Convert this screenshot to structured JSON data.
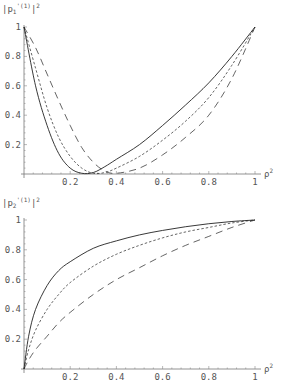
{
  "chart_data": [
    {
      "type": "line",
      "title": "",
      "ylabel": "|p1'(1)|^2",
      "xlabel": "ρ^2",
      "xlim": [
        0,
        1
      ],
      "ylim": [
        0,
        1
      ],
      "grid": false,
      "x_ticks": [
        "0.2",
        "0.4",
        "0.6",
        "0.8",
        "1"
      ],
      "y_ticks": [
        "0.2",
        "0.4",
        "0.6",
        "0.8",
        "1"
      ],
      "x": [
        0,
        0.05,
        0.1,
        0.15,
        0.2,
        0.25,
        0.3,
        0.35,
        0.4,
        0.5,
        0.6,
        0.7,
        0.8,
        0.9,
        1
      ],
      "series": [
        {
          "name": "solid",
          "style": "solid",
          "values": [
            1,
            0.6,
            0.33,
            0.14,
            0.04,
            0.005,
            0.01,
            0.05,
            0.1,
            0.2,
            0.33,
            0.47,
            0.62,
            0.8,
            1
          ]
        },
        {
          "name": "short-dashed",
          "style": "short-dash",
          "values": [
            1,
            0.72,
            0.45,
            0.25,
            0.12,
            0.04,
            0.005,
            0.01,
            0.04,
            0.12,
            0.23,
            0.36,
            0.52,
            0.74,
            1
          ]
        },
        {
          "name": "long-dashed",
          "style": "long-dash",
          "values": [
            1,
            0.86,
            0.68,
            0.5,
            0.33,
            0.18,
            0.08,
            0.02,
            0.005,
            0.04,
            0.13,
            0.25,
            0.4,
            0.65,
            1
          ]
        }
      ]
    },
    {
      "type": "line",
      "title": "",
      "ylabel": "|p2'(1)|^2",
      "xlabel": "ρ^2",
      "xlim": [
        0,
        1
      ],
      "ylim": [
        0,
        1
      ],
      "grid": false,
      "x_ticks": [
        "0.2",
        "0.4",
        "0.6",
        "0.8",
        "1"
      ],
      "y_ticks": [
        "0.2",
        "0.4",
        "0.6",
        "0.8",
        "1"
      ],
      "x": [
        0,
        0.02,
        0.05,
        0.1,
        0.15,
        0.2,
        0.3,
        0.4,
        0.5,
        0.6,
        0.7,
        0.8,
        0.9,
        1
      ],
      "series": [
        {
          "name": "solid",
          "style": "solid",
          "values": [
            0,
            0.22,
            0.4,
            0.56,
            0.66,
            0.72,
            0.81,
            0.86,
            0.9,
            0.93,
            0.955,
            0.975,
            0.99,
            1
          ]
        },
        {
          "name": "short-dashed",
          "style": "short-dash",
          "values": [
            0,
            0.13,
            0.26,
            0.4,
            0.5,
            0.58,
            0.69,
            0.77,
            0.83,
            0.88,
            0.92,
            0.95,
            0.98,
            1
          ]
        },
        {
          "name": "long-dashed",
          "style": "long-dash",
          "values": [
            0,
            0.06,
            0.13,
            0.22,
            0.31,
            0.38,
            0.5,
            0.6,
            0.68,
            0.76,
            0.83,
            0.89,
            0.95,
            1
          ]
        }
      ]
    }
  ],
  "labels": {
    "top_ylabel_main": "|p",
    "top_ylabel_sub": "1",
    "top_ylabel_sup": "'(1)",
    "top_ylabel_end": "|",
    "top_ylabel_pow": "2",
    "bottom_ylabel_main": "|p",
    "bottom_ylabel_sub": "2",
    "bottom_ylabel_sup": "'(1)",
    "bottom_ylabel_end": "|",
    "bottom_ylabel_pow": "2",
    "xlabel_main": "ρ",
    "xlabel_pow": "2"
  }
}
